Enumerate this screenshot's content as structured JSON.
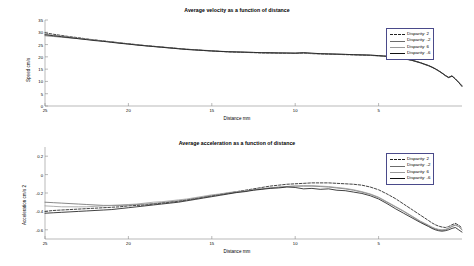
{
  "figure": {
    "background": "#ffffff",
    "axis_color": "#8a8a8a"
  },
  "chart_data": [
    {
      "type": "line",
      "id": "velocity",
      "title": "Average velocity as a function of distance",
      "xlabel": "Distance mm",
      "ylabel": "Speed cm/s",
      "xlim": [
        25,
        0
      ],
      "ylim": [
        0,
        35
      ],
      "xticks": [
        25,
        20,
        15,
        10,
        5
      ],
      "yticks": [
        0,
        5,
        10,
        15,
        20,
        25,
        30,
        35
      ],
      "grid": false,
      "legend_position": "upper right",
      "x": [
        25,
        24.5,
        24,
        23.5,
        23,
        22.5,
        22,
        21.5,
        21,
        20.5,
        20,
        19.5,
        19,
        18.5,
        18,
        17.5,
        17,
        16.5,
        16,
        15.5,
        15,
        14.5,
        14,
        13.5,
        13,
        12.5,
        12,
        11.5,
        11,
        10.5,
        10,
        9.5,
        9,
        8.5,
        8,
        7.5,
        7,
        6.5,
        6,
        5.5,
        5,
        4.5,
        4,
        3.5,
        3,
        2.5,
        2,
        1.8,
        1.6,
        1.4,
        1.2,
        1.0,
        0.8,
        0.6,
        0.4,
        0.2,
        0
      ],
      "series": [
        {
          "name": "Disparity: 2",
          "color": "#222222",
          "style": "dashed",
          "values": [
            29.8,
            29.2,
            28.7,
            28.2,
            27.8,
            27.3,
            26.9,
            26.5,
            26.1,
            25.7,
            25.3,
            25.0,
            24.6,
            24.3,
            24.0,
            23.7,
            23.4,
            23.1,
            22.9,
            22.6,
            22.4,
            22.2,
            22.0,
            21.9,
            21.8,
            21.7,
            21.6,
            21.5,
            21.5,
            21.4,
            21.4,
            21.5,
            21.3,
            21.2,
            21.1,
            21.0,
            20.9,
            20.8,
            20.7,
            20.6,
            20.4,
            20.2,
            19.8,
            19.3,
            18.6,
            17.6,
            16.4,
            15.8,
            15.1,
            14.3,
            13.4,
            12.4,
            11.6,
            12.2,
            11.0,
            9.6,
            8.2
          ]
        },
        {
          "name": "Disparity: -2",
          "color": "#6b6b6b",
          "style": "solid",
          "values": [
            28.6,
            28.3,
            28.0,
            27.7,
            27.4,
            27.1,
            26.8,
            26.4,
            26.1,
            25.7,
            25.3,
            24.9,
            24.6,
            24.3,
            24.0,
            23.7,
            23.4,
            23.1,
            22.9,
            22.7,
            22.5,
            22.3,
            22.1,
            22.0,
            21.9,
            21.8,
            21.7,
            21.6,
            21.6,
            21.5,
            21.5,
            21.6,
            21.4,
            21.3,
            21.2,
            21.1,
            21.0,
            20.9,
            20.8,
            20.7,
            20.5,
            20.3,
            19.9,
            19.4,
            18.7,
            17.7,
            16.5,
            15.9,
            15.2,
            14.4,
            13.5,
            12.5,
            11.7,
            12.3,
            11.1,
            9.7,
            8.3
          ]
        },
        {
          "name": "Disparity: 6",
          "color": "#9a9a9a",
          "style": "solid",
          "values": [
            29.2,
            28.8,
            28.4,
            28.0,
            27.6,
            27.2,
            26.8,
            26.4,
            26.0,
            25.6,
            25.2,
            24.9,
            24.5,
            24.2,
            23.9,
            23.6,
            23.3,
            23.0,
            22.8,
            22.6,
            22.4,
            22.2,
            22.1,
            22.0,
            21.9,
            21.8,
            21.7,
            21.6,
            21.6,
            21.5,
            21.5,
            21.6,
            21.4,
            21.3,
            21.2,
            21.1,
            21.0,
            20.9,
            20.8,
            20.6,
            20.4,
            20.1,
            19.7,
            19.2,
            18.5,
            17.5,
            16.3,
            15.7,
            15.0,
            14.2,
            13.3,
            12.3,
            11.5,
            12.1,
            10.9,
            9.5,
            8.1
          ]
        },
        {
          "name": "Disparity: -6",
          "color": "#111111",
          "style": "solid",
          "values": [
            29.0,
            28.6,
            28.2,
            27.8,
            27.4,
            27.0,
            26.6,
            26.3,
            25.9,
            25.5,
            25.2,
            24.8,
            24.5,
            24.2,
            23.9,
            23.6,
            23.3,
            23.0,
            22.8,
            22.6,
            22.4,
            22.2,
            22.1,
            22.0,
            21.9,
            21.8,
            21.7,
            21.7,
            21.6,
            21.6,
            21.5,
            21.7,
            21.5,
            21.3,
            21.2,
            21.1,
            21.0,
            20.9,
            20.8,
            20.7,
            20.5,
            20.2,
            19.8,
            19.3,
            18.6,
            17.6,
            16.4,
            15.8,
            15.1,
            14.3,
            13.4,
            12.4,
            11.6,
            12.2,
            11.0,
            9.6,
            7.9
          ]
        }
      ]
    },
    {
      "type": "line",
      "id": "acceleration",
      "title": "Average acceleration as a function of distance",
      "xlabel": "Distance mm",
      "ylabel": "Acceleration cm/s 2",
      "xlim": [
        25,
        0
      ],
      "ylim": [
        -0.7,
        0.3
      ],
      "xticks": [
        25,
        20,
        15,
        10,
        5
      ],
      "yticks": [
        0.2,
        0,
        -0.2,
        -0.4,
        -0.6
      ],
      "grid": false,
      "legend_position": "upper right",
      "x": [
        25,
        24.5,
        24,
        23.5,
        23,
        22.5,
        22,
        21.5,
        21,
        20.5,
        20,
        19.5,
        19,
        18.5,
        18,
        17.5,
        17,
        16.5,
        16,
        15.5,
        15,
        14.5,
        14,
        13.5,
        13,
        12.5,
        12,
        11.5,
        11,
        10.5,
        10,
        9.5,
        9,
        8.5,
        8,
        7.5,
        7,
        6.5,
        6,
        5.5,
        5,
        4.5,
        4,
        3.5,
        3,
        2.5,
        2,
        1.8,
        1.6,
        1.4,
        1.2,
        1.0,
        0.8,
        0.6,
        0.4,
        0.2,
        0
      ],
      "series": [
        {
          "name": "Disparity: 2",
          "color": "#222222",
          "style": "dashed",
          "values": [
            -0.4,
            -0.39,
            -0.385,
            -0.38,
            -0.375,
            -0.37,
            -0.365,
            -0.36,
            -0.355,
            -0.35,
            -0.34,
            -0.335,
            -0.33,
            -0.32,
            -0.31,
            -0.3,
            -0.29,
            -0.275,
            -0.26,
            -0.245,
            -0.23,
            -0.215,
            -0.2,
            -0.185,
            -0.17,
            -0.155,
            -0.14,
            -0.125,
            -0.115,
            -0.105,
            -0.1,
            -0.095,
            -0.09,
            -0.09,
            -0.09,
            -0.095,
            -0.1,
            -0.105,
            -0.115,
            -0.135,
            -0.165,
            -0.21,
            -0.26,
            -0.32,
            -0.38,
            -0.44,
            -0.5,
            -0.525,
            -0.545,
            -0.56,
            -0.57,
            -0.575,
            -0.565,
            -0.545,
            -0.53,
            -0.55,
            -0.58
          ]
        },
        {
          "name": "Disparity: -2",
          "color": "#6b6b6b",
          "style": "solid",
          "values": [
            -0.3,
            -0.305,
            -0.31,
            -0.315,
            -0.32,
            -0.325,
            -0.33,
            -0.335,
            -0.335,
            -0.335,
            -0.33,
            -0.325,
            -0.32,
            -0.315,
            -0.305,
            -0.295,
            -0.285,
            -0.275,
            -0.26,
            -0.245,
            -0.23,
            -0.215,
            -0.205,
            -0.19,
            -0.18,
            -0.165,
            -0.155,
            -0.145,
            -0.135,
            -0.13,
            -0.125,
            -0.125,
            -0.125,
            -0.13,
            -0.135,
            -0.145,
            -0.155,
            -0.17,
            -0.19,
            -0.215,
            -0.25,
            -0.3,
            -0.35,
            -0.4,
            -0.455,
            -0.51,
            -0.555,
            -0.575,
            -0.59,
            -0.6,
            -0.605,
            -0.6,
            -0.585,
            -0.565,
            -0.55,
            -0.565,
            -0.6
          ]
        },
        {
          "name": "Disparity: 6",
          "color": "#9a9a9a",
          "style": "solid",
          "values": [
            -0.34,
            -0.345,
            -0.35,
            -0.35,
            -0.35,
            -0.35,
            -0.345,
            -0.34,
            -0.335,
            -0.33,
            -0.325,
            -0.32,
            -0.31,
            -0.3,
            -0.295,
            -0.285,
            -0.275,
            -0.265,
            -0.25,
            -0.235,
            -0.22,
            -0.21,
            -0.195,
            -0.185,
            -0.175,
            -0.165,
            -0.155,
            -0.145,
            -0.14,
            -0.13,
            -0.125,
            -0.12,
            -0.12,
            -0.125,
            -0.13,
            -0.14,
            -0.15,
            -0.165,
            -0.185,
            -0.21,
            -0.245,
            -0.295,
            -0.345,
            -0.395,
            -0.45,
            -0.505,
            -0.55,
            -0.57,
            -0.585,
            -0.595,
            -0.6,
            -0.595,
            -0.58,
            -0.56,
            -0.545,
            -0.56,
            -0.595
          ]
        },
        {
          "name": "Disparity: -6",
          "color": "#111111",
          "style": "solid",
          "values": [
            -0.42,
            -0.415,
            -0.41,
            -0.405,
            -0.4,
            -0.395,
            -0.39,
            -0.385,
            -0.38,
            -0.37,
            -0.36,
            -0.35,
            -0.34,
            -0.33,
            -0.32,
            -0.31,
            -0.3,
            -0.285,
            -0.27,
            -0.255,
            -0.24,
            -0.225,
            -0.21,
            -0.195,
            -0.185,
            -0.17,
            -0.16,
            -0.15,
            -0.145,
            -0.135,
            -0.14,
            -0.155,
            -0.15,
            -0.16,
            -0.155,
            -0.17,
            -0.175,
            -0.19,
            -0.205,
            -0.23,
            -0.265,
            -0.315,
            -0.37,
            -0.42,
            -0.47,
            -0.52,
            -0.565,
            -0.585,
            -0.6,
            -0.61,
            -0.615,
            -0.61,
            -0.6,
            -0.585,
            -0.575,
            -0.6,
            -0.625
          ]
        }
      ]
    }
  ]
}
